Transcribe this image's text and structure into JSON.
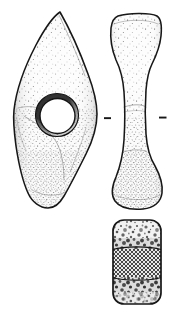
{
  "document": {
    "type": "archaeological-line-drawing",
    "title": "Shaft-hole battle-axe",
    "background_color": "#ffffff",
    "ink_color": "#1a1a1a",
    "stipple_color": "#2b2b2b",
    "fill_color": "#fbfbfb",
    "width": 175,
    "height": 317
  },
  "views": [
    {
      "id": "plan-view",
      "name": "plan-view-lozenge-face",
      "label": "Plan view",
      "description": "Lozenge-shaped axe face with central circular shaft hole, pointed blade at top and rounded butt at bottom",
      "outline_color": "#1a1a1a",
      "shading": "stipple",
      "bounds": {
        "x": 13,
        "y": 11,
        "width": 86,
        "height": 198
      },
      "features": [
        {
          "name": "blade-tip",
          "label": "Blade tip",
          "position": "top"
        },
        {
          "name": "shaft-hole",
          "label": "Shaft hole",
          "shape": "circle",
          "cx": 57,
          "cy": 115,
          "r": 20
        },
        {
          "name": "butt-end",
          "label": "Butt end",
          "position": "bottom"
        },
        {
          "name": "facet-ridge",
          "label": "Facet ridge",
          "position": "left-lower"
        }
      ]
    },
    {
      "id": "profile-view",
      "name": "profile-view-side",
      "label": "Side profile view",
      "description": "Waisted side profile of the axe, widening at both head and butt with a narrow central waist at the shaft hole",
      "outline_color": "#1a1a1a",
      "shading": "stipple",
      "bounds": {
        "x": 108,
        "y": 13,
        "width": 56,
        "height": 196
      },
      "features": [
        {
          "name": "head-end",
          "label": "Head end",
          "position": "top"
        },
        {
          "name": "waist",
          "label": "Waisted midsection",
          "position": "middle"
        },
        {
          "name": "butt-flare",
          "label": "Flared butt",
          "position": "bottom"
        },
        {
          "name": "section-tick-left",
          "label": "Section indicator (left)",
          "x": 104,
          "y": 118
        },
        {
          "name": "section-tick-right",
          "label": "Section indicator (right)",
          "x": 159,
          "y": 118
        }
      ]
    },
    {
      "id": "cross-section",
      "name": "cross-section-view",
      "label": "Cross-section",
      "description": "Rounded rectangular cross-section through the shaft hole, with mottled stone texture at top and bottom and cross-hatched cut surface in the middle band",
      "outline_color": "#1a1a1a",
      "bounds": {
        "x": 112,
        "y": 219,
        "width": 50,
        "height": 86
      },
      "bands": [
        {
          "name": "section-band-top",
          "label": "Mottled stone texture (upper)",
          "fill": "mottle"
        },
        {
          "name": "section-band-middle",
          "label": "Cross-hatched cut surface",
          "fill": "cross-hatch"
        },
        {
          "name": "section-band-bottom",
          "label": "Mottled stone texture (lower)",
          "fill": "mottle"
        }
      ]
    }
  ],
  "annotations": {
    "tick_marks": 2,
    "tick_color": "#1a1a1a",
    "scale_bar": null,
    "catalogue_number": null,
    "caption_text": null
  }
}
